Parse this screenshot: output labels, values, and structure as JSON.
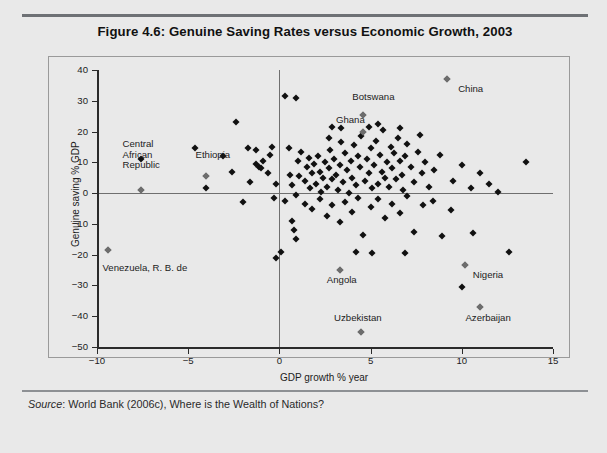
{
  "figure": {
    "title": "Figure 4.6: Genuine Saving Rates versus Economic Growth, 2003",
    "source": "Source",
    "source_rest": ": World Bank (2006c), Where is the Wealth of Nations?"
  },
  "chart_data": {
    "type": "scatter",
    "title": "Figure 4.6: Genuine Saving Rates versus Economic Growth, 2003",
    "xlabel": "GDP growth % year",
    "ylabel": "Genuine saving % GDP",
    "xlim": [
      -10,
      15
    ],
    "ylim": [
      -50,
      40
    ],
    "xticks": [
      -10,
      -5,
      0,
      5,
      10,
      15
    ],
    "xticklabels": [
      "-10",
      "-5",
      "0",
      "5",
      "10",
      "15"
    ],
    "yticks": [
      40,
      30,
      20,
      10,
      0,
      -10,
      -20,
      -30,
      -40,
      -50
    ],
    "yticklabels": [
      "40",
      "30",
      "20",
      "10",
      "0",
      "-10",
      "-20",
      "-30",
      "-40",
      "-50"
    ],
    "grid": false,
    "legend": "none",
    "zero_lines": {
      "x": 0,
      "y": 0
    },
    "marker": "diamond",
    "marker_color": "#111111",
    "annotation_marker_color": "#6d6d6d",
    "annotations": [
      {
        "label": "Central\nAfrican\nRepublic",
        "x": -7.6,
        "y": 1.0,
        "lx": -8.6,
        "ly": 15.5
      },
      {
        "label": "Ethiopia",
        "x": -4.0,
        "y": 5.5,
        "lx": -4.6,
        "ly": 12.0
      },
      {
        "label": "Botswana",
        "x": 4.6,
        "y": 25.5,
        "lx": 4.0,
        "ly": 31.0
      },
      {
        "label": "Ghana",
        "x": 4.6,
        "y": 20.0,
        "lx": 3.1,
        "ly": 23.5
      },
      {
        "label": "China",
        "x": 9.2,
        "y": 37.0,
        "lx": 9.8,
        "ly": 33.5
      },
      {
        "label": "Venezuela, R. B. de",
        "x": -9.4,
        "y": -18.5,
        "lx": -9.7,
        "ly": -24.5
      },
      {
        "label": "Angola",
        "x": 3.3,
        "y": -25.0,
        "lx": 2.6,
        "ly": -28.5
      },
      {
        "label": "Uzbekistan",
        "x": 4.5,
        "y": -45.0,
        "lx": 3.0,
        "ly": -41.0
      },
      {
        "label": "Nigeria",
        "x": 10.2,
        "y": -23.5,
        "lx": 10.6,
        "ly": -27.0
      },
      {
        "label": "Azerbaijan",
        "x": 11.0,
        "y": -37.0,
        "lx": 10.2,
        "ly": -41.0
      }
    ],
    "points": [
      [
        -9.4,
        -18.5
      ],
      [
        -7.6,
        1.0
      ],
      [
        -7.6,
        11.0
      ],
      [
        -4.6,
        14.5
      ],
      [
        -4.0,
        5.5
      ],
      [
        -4.0,
        1.5
      ],
      [
        -2.4,
        23.0
      ],
      [
        -1.7,
        14.5
      ],
      [
        -1.3,
        14.0
      ],
      [
        -1.3,
        9.5
      ],
      [
        -1.1,
        8.5
      ],
      [
        -1.0,
        8.0
      ],
      [
        -0.9,
        10.5
      ],
      [
        -0.6,
        6.5
      ],
      [
        -0.5,
        12.5
      ],
      [
        -0.4,
        15.0
      ],
      [
        -0.3,
        -1.5
      ],
      [
        -0.2,
        3.0
      ],
      [
        -2.0,
        -3.0
      ],
      [
        -1.6,
        3.5
      ],
      [
        -2.6,
        7.0
      ],
      [
        -3.1,
        12.0
      ],
      [
        0.3,
        31.5
      ],
      [
        0.9,
        31.0
      ],
      [
        0.5,
        14.5
      ],
      [
        0.6,
        6.0
      ],
      [
        0.7,
        2.5
      ],
      [
        0.9,
        -0.5
      ],
      [
        1.0,
        10.5
      ],
      [
        1.1,
        5.5
      ],
      [
        1.2,
        13.5
      ],
      [
        1.4,
        4.0
      ],
      [
        1.5,
        8.5
      ],
      [
        1.6,
        11.5
      ],
      [
        1.7,
        1.5
      ],
      [
        1.8,
        6.5
      ],
      [
        1.9,
        9.5
      ],
      [
        2.0,
        3.0
      ],
      [
        2.1,
        12.0
      ],
      [
        2.2,
        7.0
      ],
      [
        2.3,
        0.5
      ],
      [
        2.4,
        5.0
      ],
      [
        2.5,
        10.0
      ],
      [
        2.6,
        2.0
      ],
      [
        2.7,
        8.0
      ],
      [
        2.8,
        14.0
      ],
      [
        2.9,
        4.5
      ],
      [
        3.0,
        11.0
      ],
      [
        3.1,
        6.0
      ],
      [
        3.2,
        1.0
      ],
      [
        3.3,
        9.0
      ],
      [
        3.4,
        16.5
      ],
      [
        3.5,
        3.5
      ],
      [
        3.6,
        13.0
      ],
      [
        3.7,
        7.5
      ],
      [
        3.8,
        0.0
      ],
      [
        3.9,
        10.5
      ],
      [
        4.0,
        5.0
      ],
      [
        4.1,
        15.5
      ],
      [
        4.2,
        2.5
      ],
      [
        4.3,
        12.0
      ],
      [
        4.4,
        8.5
      ],
      [
        4.5,
        18.5
      ],
      [
        4.6,
        25.5
      ],
      [
        4.6,
        20.0
      ],
      [
        4.7,
        4.0
      ],
      [
        4.8,
        11.0
      ],
      [
        4.9,
        6.5
      ],
      [
        5.0,
        14.5
      ],
      [
        5.1,
        1.5
      ],
      [
        5.2,
        9.0
      ],
      [
        5.3,
        17.0
      ],
      [
        5.4,
        3.0
      ],
      [
        5.5,
        12.5
      ],
      [
        5.6,
        7.0
      ],
      [
        5.7,
        20.5
      ],
      [
        5.8,
        5.0
      ],
      [
        5.9,
        10.0
      ],
      [
        6.0,
        2.0
      ],
      [
        6.1,
        15.0
      ],
      [
        6.2,
        8.0
      ],
      [
        6.3,
        13.0
      ],
      [
        6.4,
        4.5
      ],
      [
        6.5,
        18.0
      ],
      [
        6.6,
        10.5
      ],
      [
        6.7,
        6.0
      ],
      [
        6.8,
        1.0
      ],
      [
        6.9,
        12.0
      ],
      [
        7.0,
        16.0
      ],
      [
        7.2,
        8.5
      ],
      [
        7.4,
        3.5
      ],
      [
        7.6,
        13.5
      ],
      [
        7.8,
        6.5
      ],
      [
        8.0,
        10.0
      ],
      [
        8.2,
        2.0
      ],
      [
        8.5,
        7.5
      ],
      [
        8.8,
        12.5
      ],
      [
        9.2,
        37.0
      ],
      [
        9.5,
        4.0
      ],
      [
        10.0,
        9.0
      ],
      [
        10.5,
        1.5
      ],
      [
        11.0,
        6.5
      ],
      [
        11.5,
        3.0
      ],
      [
        12.0,
        0.5
      ],
      [
        13.5,
        10.0
      ],
      [
        2.9,
        21.5
      ],
      [
        3.4,
        21.0
      ],
      [
        2.7,
        18.0
      ],
      [
        5.4,
        22.5
      ],
      [
        4.9,
        21.5
      ],
      [
        6.6,
        21.0
      ],
      [
        7.7,
        19.0
      ],
      [
        0.3,
        -2.5
      ],
      [
        0.7,
        -9.0
      ],
      [
        0.8,
        -12.0
      ],
      [
        0.9,
        -15.0
      ],
      [
        1.4,
        -3.5
      ],
      [
        1.8,
        -5.0
      ],
      [
        2.2,
        -2.0
      ],
      [
        2.6,
        -7.5
      ],
      [
        2.9,
        -4.0
      ],
      [
        3.3,
        -25.0
      ],
      [
        3.3,
        -9.5
      ],
      [
        3.6,
        -3.0
      ],
      [
        4.0,
        -6.0
      ],
      [
        4.3,
        -1.5
      ],
      [
        4.5,
        -45.0
      ],
      [
        4.6,
        -13.5
      ],
      [
        5.0,
        -4.5
      ],
      [
        5.4,
        -2.0
      ],
      [
        5.8,
        -8.0
      ],
      [
        6.2,
        -3.5
      ],
      [
        6.6,
        -6.5
      ],
      [
        7.0,
        -1.0
      ],
      [
        7.4,
        -12.5
      ],
      [
        7.9,
        -4.0
      ],
      [
        8.4,
        -2.5
      ],
      [
        8.9,
        -14.0
      ],
      [
        9.4,
        -5.5
      ],
      [
        10.2,
        -23.5
      ],
      [
        10.6,
        -13.0
      ],
      [
        11.0,
        -37.0
      ],
      [
        10.0,
        -30.5
      ],
      [
        12.6,
        -19.0
      ],
      [
        5.1,
        -19.5
      ],
      [
        4.2,
        -19.0
      ],
      [
        6.9,
        -19.5
      ],
      [
        0.1,
        -19.0
      ],
      [
        -0.2,
        -21.0
      ]
    ]
  }
}
